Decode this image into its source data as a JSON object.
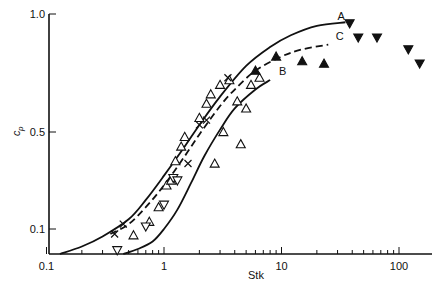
{
  "chart_data": {
    "type": "scatter",
    "title": "",
    "xlabel": "Stk",
    "ylabel": "c_p",
    "xscale": "log",
    "xlim": [
      0.1,
      160
    ],
    "ylim": [
      0,
      1.0
    ],
    "xticks": [
      {
        "value": 0.1,
        "label": "0.1"
      },
      {
        "value": 1,
        "label": "1"
      },
      {
        "value": 10,
        "label": "10"
      },
      {
        "value": 100,
        "label": "100"
      }
    ],
    "yticks": [
      {
        "value": 1.0,
        "label": "1.0"
      },
      {
        "value": 0.5,
        "label": "0.5"
      },
      {
        "value": 0.1,
        "label": "0.1"
      }
    ],
    "grid": false,
    "legend": "none",
    "curves": [
      {
        "name": "A",
        "style": "solid",
        "points": [
          [
            0.13,
            0.0
          ],
          [
            0.2,
            0.03
          ],
          [
            0.3,
            0.07
          ],
          [
            0.5,
            0.14
          ],
          [
            0.7,
            0.22
          ],
          [
            1.0,
            0.32
          ],
          [
            1.5,
            0.44
          ],
          [
            2.0,
            0.53
          ],
          [
            3.0,
            0.65
          ],
          [
            5.0,
            0.78
          ],
          [
            8.0,
            0.86
          ],
          [
            12,
            0.91
          ],
          [
            20,
            0.95
          ],
          [
            35,
            0.965
          ]
        ]
      },
      {
        "name": "C",
        "style": "dashed",
        "points": [
          [
            0.35,
            0.08
          ],
          [
            0.5,
            0.12
          ],
          [
            0.7,
            0.19
          ],
          [
            1.0,
            0.28
          ],
          [
            1.5,
            0.4
          ],
          [
            2.0,
            0.49
          ],
          [
            3.0,
            0.61
          ],
          [
            4.0,
            0.68
          ],
          [
            6.0,
            0.76
          ],
          [
            10,
            0.82
          ],
          [
            15,
            0.85
          ],
          [
            25,
            0.87
          ]
        ]
      },
      {
        "name": "B",
        "style": "solid",
        "points": [
          [
            0.45,
            0.0
          ],
          [
            0.6,
            0.02
          ],
          [
            0.8,
            0.05
          ],
          [
            1.0,
            0.1
          ],
          [
            1.3,
            0.18
          ],
          [
            1.7,
            0.29
          ],
          [
            2.2,
            0.4
          ],
          [
            3.0,
            0.51
          ],
          [
            4.0,
            0.6
          ],
          [
            6.0,
            0.68
          ],
          [
            8.0,
            0.72
          ]
        ]
      }
    ],
    "series": [
      {
        "name": "open-triangle-up",
        "marker": "triangle-up",
        "fill": "none",
        "points": [
          [
            0.55,
            0.075
          ],
          [
            0.75,
            0.13
          ],
          [
            0.9,
            0.19
          ],
          [
            1.05,
            0.28
          ],
          [
            1.15,
            0.3
          ],
          [
            1.25,
            0.38
          ],
          [
            1.4,
            0.44
          ],
          [
            1.5,
            0.48
          ],
          [
            2.0,
            0.56
          ],
          [
            2.3,
            0.62
          ],
          [
            2.5,
            0.66
          ],
          [
            3.0,
            0.7
          ],
          [
            3.6,
            0.72
          ],
          [
            3.2,
            0.5
          ],
          [
            4.2,
            0.63
          ],
          [
            5.0,
            0.6
          ],
          [
            2.7,
            0.37
          ],
          [
            4.5,
            0.45
          ],
          [
            5.5,
            0.7
          ],
          [
            6.5,
            0.73
          ]
        ]
      },
      {
        "name": "open-triangle-down",
        "marker": "triangle-down",
        "fill": "none",
        "points": [
          [
            0.4,
            0.015
          ],
          [
            0.7,
            0.11
          ],
          [
            1.0,
            0.2
          ],
          [
            1.2,
            0.31
          ],
          [
            1.3,
            0.3
          ]
        ]
      },
      {
        "name": "cross",
        "marker": "x",
        "points": [
          [
            0.38,
            0.08
          ],
          [
            0.45,
            0.12
          ],
          [
            1.6,
            0.37
          ],
          [
            2.0,
            0.53
          ],
          [
            2.3,
            0.55
          ],
          [
            3.5,
            0.73
          ]
        ]
      },
      {
        "name": "filled-triangle-up",
        "marker": "triangle-up",
        "fill": "solid",
        "points": [
          [
            6.0,
            0.76
          ],
          [
            9.0,
            0.82
          ],
          [
            15,
            0.8
          ],
          [
            23,
            0.79
          ]
        ]
      },
      {
        "name": "filled-triangle-down",
        "marker": "triangle-down",
        "fill": "solid",
        "points": [
          [
            38,
            0.96
          ],
          [
            45,
            0.9
          ],
          [
            65,
            0.9
          ],
          [
            120,
            0.85
          ],
          [
            150,
            0.79
          ]
        ]
      }
    ],
    "annotations": [
      {
        "text": "A",
        "x": 30,
        "y": 0.975
      },
      {
        "text": "C",
        "x": 29,
        "y": 0.89
      },
      {
        "text": "B",
        "x": 9.5,
        "y": 0.74
      }
    ]
  }
}
